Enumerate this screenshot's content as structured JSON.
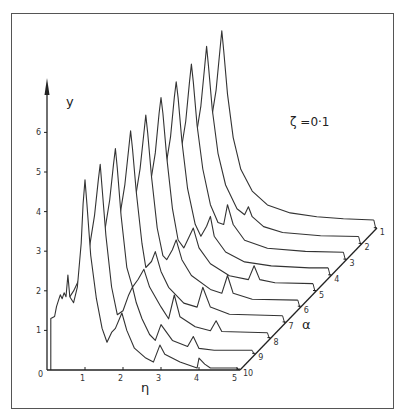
{
  "chart_data": {
    "type": "line",
    "subtype": "3d-waterfall",
    "title": "",
    "annotation": "ζ =0·1",
    "xlabel": "η",
    "ylabel": "y",
    "zlabel": "α",
    "xlim": [
      0,
      5
    ],
    "ylim": [
      0,
      6.9
    ],
    "x_ticks": [
      "0",
      "1",
      "2",
      "3",
      "4",
      "5"
    ],
    "y_ticks": [
      "1",
      "2",
      "3",
      "4",
      "5",
      "6"
    ],
    "z_ticks": [
      "1",
      "2",
      "3",
      "4",
      "5",
      "6",
      "7",
      "8",
      "9",
      "10"
    ],
    "grid": false,
    "legend": null,
    "series": [
      {
        "name": "α=1",
        "alpha": 1,
        "peak": {
          "eta": 1.0,
          "y": 5.0
        },
        "x": [
          0.1,
          0.3,
          0.5,
          0.7,
          0.85,
          0.95,
          1.0,
          1.05,
          1.15,
          1.3,
          1.5,
          1.8,
          2.2,
          2.8,
          3.5,
          4.2,
          5.0
        ],
        "values": [
          1.3,
          1.6,
          2.0,
          2.6,
          3.5,
          4.5,
          5.0,
          4.5,
          3.4,
          2.3,
          1.5,
          0.95,
          0.6,
          0.4,
          0.3,
          0.25,
          0.22
        ]
      },
      {
        "name": "α=2",
        "alpha": 2,
        "peak": {
          "eta": 1.0,
          "y": 5.0
        },
        "x": [
          0.1,
          0.3,
          0.5,
          0.7,
          0.85,
          0.95,
          1.0,
          1.05,
          1.15,
          1.3,
          1.5,
          1.8,
          2.0,
          2.1,
          2.2,
          2.5,
          3.0,
          4.0,
          5.0
        ],
        "values": [
          1.3,
          1.6,
          2.0,
          2.6,
          3.5,
          4.5,
          5.0,
          4.5,
          3.4,
          2.3,
          1.5,
          0.9,
          0.75,
          0.95,
          0.7,
          0.45,
          0.3,
          0.22,
          0.2
        ]
      },
      {
        "name": "α=3",
        "alpha": 3,
        "peak": {
          "eta": 1.0,
          "y": 4.95
        },
        "x": [
          0.1,
          0.3,
          0.5,
          0.7,
          0.85,
          0.95,
          1.0,
          1.05,
          1.15,
          1.3,
          1.5,
          1.7,
          1.85,
          1.95,
          2.1,
          2.4,
          3.0,
          4.0,
          5.0
        ],
        "values": [
          1.3,
          1.6,
          2.0,
          2.6,
          3.5,
          4.5,
          4.95,
          4.5,
          3.4,
          2.3,
          1.4,
          0.95,
          0.9,
          1.4,
          0.9,
          0.5,
          0.3,
          0.22,
          0.2
        ]
      },
      {
        "name": "α=4",
        "alpha": 4,
        "peak": {
          "eta": 1.0,
          "y": 4.9
        },
        "x": [
          0.1,
          0.3,
          0.5,
          0.7,
          0.85,
          0.95,
          1.0,
          1.05,
          1.15,
          1.3,
          1.5,
          1.65,
          1.8,
          1.9,
          2.0,
          2.3,
          2.8,
          3.5,
          4.5,
          5.0
        ],
        "values": [
          1.3,
          1.6,
          2.0,
          2.6,
          3.5,
          4.5,
          4.9,
          4.5,
          3.4,
          2.2,
          1.3,
          1.0,
          1.25,
          1.5,
          1.0,
          0.6,
          0.35,
          0.25,
          0.2,
          0.2
        ]
      },
      {
        "name": "α=5",
        "alpha": 5,
        "peak": {
          "eta": 1.0,
          "y": 4.9
        },
        "x": [
          0.1,
          0.3,
          0.5,
          0.7,
          0.85,
          0.95,
          1.0,
          1.05,
          1.15,
          1.3,
          1.45,
          1.6,
          1.75,
          1.85,
          2.0,
          2.3,
          2.8,
          3.3,
          3.45,
          3.6,
          4.0,
          5.0
        ],
        "values": [
          1.3,
          1.6,
          2.0,
          2.6,
          3.5,
          4.5,
          4.9,
          4.5,
          3.4,
          2.1,
          1.3,
          1.1,
          1.4,
          1.6,
          1.1,
          0.7,
          0.4,
          0.3,
          0.65,
          0.3,
          0.22,
          0.2
        ]
      },
      {
        "name": "α=6",
        "alpha": 6,
        "peak": {
          "eta": 1.0,
          "y": 4.85
        },
        "x": [
          0.1,
          0.3,
          0.5,
          0.7,
          0.85,
          0.95,
          1.0,
          1.05,
          1.15,
          1.3,
          1.45,
          1.55,
          1.7,
          1.8,
          1.95,
          2.2,
          2.7,
          3.0,
          3.15,
          3.3,
          3.8,
          5.0
        ],
        "values": [
          1.3,
          1.6,
          2.0,
          2.6,
          3.5,
          4.4,
          4.85,
          4.4,
          3.3,
          2.0,
          1.3,
          1.2,
          1.45,
          1.7,
          1.2,
          0.8,
          0.45,
          0.35,
          0.8,
          0.35,
          0.2,
          0.18
        ]
      },
      {
        "name": "α=7",
        "alpha": 7,
        "peak": {
          "eta": 1.0,
          "y": 4.85
        },
        "x": [
          0.1,
          0.3,
          0.5,
          0.7,
          0.85,
          0.95,
          1.0,
          1.05,
          1.15,
          1.3,
          1.4,
          1.55,
          1.65,
          1.8,
          2.0,
          2.4,
          2.75,
          2.9,
          3.1,
          3.6,
          5.0
        ],
        "values": [
          1.3,
          1.6,
          2.0,
          2.6,
          3.5,
          4.4,
          4.85,
          4.4,
          3.3,
          2.0,
          1.4,
          1.55,
          1.8,
          1.3,
          0.9,
          0.5,
          0.4,
          0.9,
          0.4,
          0.22,
          0.18
        ]
      },
      {
        "name": "α=8",
        "alpha": 8,
        "peak": {
          "eta": 1.0,
          "y": 4.8
        },
        "x": [
          0.1,
          0.3,
          0.5,
          0.7,
          0.85,
          0.95,
          1.0,
          1.05,
          1.15,
          1.3,
          1.45,
          1.6,
          1.75,
          1.9,
          2.2,
          2.4,
          2.55,
          2.7,
          3.1,
          3.5,
          3.65,
          3.8,
          5.0
        ],
        "values": [
          1.3,
          1.6,
          2.0,
          2.6,
          3.5,
          4.4,
          4.8,
          4.3,
          3.1,
          1.8,
          1.3,
          1.5,
          1.75,
          1.3,
          0.8,
          0.5,
          1.1,
          0.55,
          0.3,
          0.2,
          0.45,
          0.18,
          0.15
        ]
      },
      {
        "name": "α=9",
        "alpha": 9,
        "peak": {
          "eta": 1.0,
          "y": 4.8
        },
        "x": [
          0.1,
          0.3,
          0.5,
          0.7,
          0.85,
          0.95,
          1.0,
          1.05,
          1.15,
          1.3,
          1.45,
          1.6,
          1.75,
          1.85,
          1.95,
          2.1,
          2.3,
          2.45,
          2.6,
          2.9,
          3.3,
          3.45,
          3.6,
          4.0,
          5.0
        ],
        "values": [
          1.3,
          1.6,
          2.0,
          2.6,
          3.5,
          4.4,
          4.8,
          4.2,
          3.0,
          1.7,
          1.0,
          1.1,
          1.5,
          1.7,
          1.3,
          0.9,
          0.5,
          0.35,
          0.75,
          0.35,
          0.2,
          0.45,
          0.15,
          0.1,
          0.1
        ]
      },
      {
        "name": "α=10",
        "alpha": 10,
        "peak": {
          "eta": 1.0,
          "y": 4.8
        },
        "x": [
          0.1,
          0.1,
          0.2,
          0.25,
          0.3,
          0.35,
          0.4,
          0.45,
          0.5,
          0.55,
          0.6,
          0.7,
          0.8,
          0.9,
          0.95,
          1.0,
          1.05,
          1.15,
          1.3,
          1.45,
          1.58,
          1.7,
          1.8,
          1.97,
          2.1,
          2.3,
          2.6,
          2.8,
          2.97,
          3.1,
          3.5,
          3.95,
          4.0,
          4.05,
          4.15,
          4.3,
          5.0
        ],
        "values": [
          0.0,
          1.3,
          1.35,
          1.6,
          1.75,
          1.9,
          1.8,
          1.95,
          1.85,
          2.4,
          1.85,
          1.7,
          2.1,
          3.2,
          4.2,
          4.8,
          4.2,
          2.9,
          1.8,
          1.05,
          0.7,
          0.95,
          1.05,
          1.44,
          1.0,
          0.55,
          0.3,
          0.2,
          0.63,
          0.4,
          0.2,
          0.05,
          0.3,
          0.25,
          0.15,
          0.05,
          0.05
        ]
      }
    ],
    "projection": {
      "origin_px": [
        47,
        370
      ],
      "eta_unit_px": 38,
      "y_unit_px": 39.6,
      "alpha_step_px": [
        15.2,
        -15.7
      ]
    }
  }
}
